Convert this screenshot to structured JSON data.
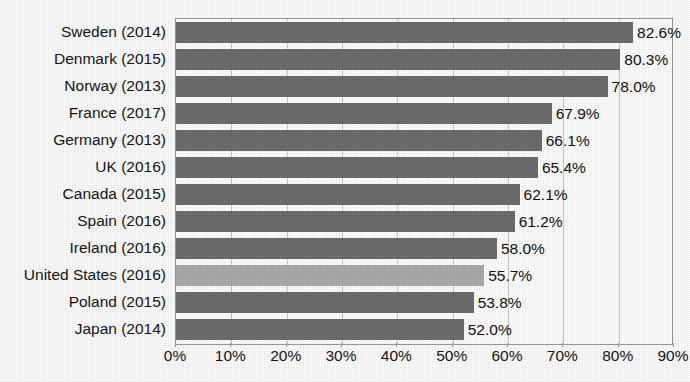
{
  "chart_data": {
    "type": "bar",
    "orientation": "horizontal",
    "title": "",
    "xlabel": "",
    "ylabel": "",
    "xlim": [
      0,
      90
    ],
    "xticks": [
      "0%",
      "10%",
      "20%",
      "30%",
      "40%",
      "50%",
      "60%",
      "70%",
      "80%",
      "90%"
    ],
    "xtick_values": [
      0,
      10,
      20,
      30,
      40,
      50,
      60,
      70,
      80,
      90
    ],
    "grid": "vertical",
    "legend": "none",
    "categories": [
      "Sweden (2014)",
      "Denmark (2015)",
      "Norway (2013)",
      "France (2017)",
      "Germany (2013)",
      "UK (2016)",
      "Canada (2015)",
      "Spain (2016)",
      "Ireland (2016)",
      "United States (2016)",
      "Poland (2015)",
      "Japan (2014)"
    ],
    "values": [
      82.6,
      80.3,
      78.0,
      67.9,
      66.1,
      65.4,
      62.1,
      61.2,
      58.0,
      55.7,
      53.8,
      52.0
    ],
    "value_labels": [
      "82.6%",
      "80.3%",
      "78.0%",
      "67.9%",
      "66.1%",
      "65.4%",
      "62.1%",
      "61.2%",
      "58.0%",
      "55.7%",
      "53.8%",
      "52.0%"
    ],
    "highlighted_index": 9,
    "colors": {
      "bar": "#6e6e6e",
      "bar_highlight": "#adadad",
      "gridline": "#c9c9c9",
      "axis": "#9a9a9a",
      "text": "#161616",
      "background": "#ffffff"
    }
  }
}
